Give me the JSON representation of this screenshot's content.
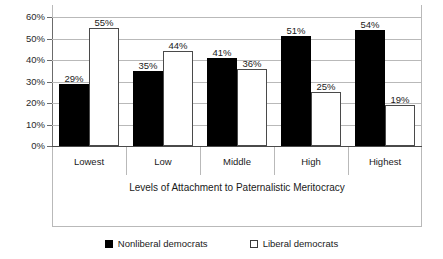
{
  "chart_data": {
    "type": "bar",
    "title": "",
    "subtitle": "",
    "xlabel": "Levels of Attachment to Paternalistic Meritocracy",
    "ylabel": "",
    "categories": [
      "Lowest",
      "Low",
      "Middle",
      "High",
      "Highest"
    ],
    "series": [
      {
        "name": "Nonliberal democrats",
        "values": [
          29,
          35,
          41,
          51,
          54
        ],
        "labels": [
          "29%",
          "35%",
          "41%",
          "51%",
          "54%"
        ],
        "color": "#000000",
        "swatch": "filled-square"
      },
      {
        "name": "Liberal democrats",
        "values": [
          55,
          44,
          36,
          25,
          19
        ],
        "labels": [
          "55%",
          "44%",
          "36%",
          "25%",
          "19%"
        ],
        "color": "#ffffff",
        "swatch": "open-square"
      }
    ],
    "ylim": [
      0,
      60
    ],
    "ytick_values": [
      0,
      10,
      20,
      30,
      40,
      50,
      60
    ],
    "ytick_labels": [
      "0%",
      "10%",
      "20%",
      "30%",
      "40%",
      "50%",
      "60%"
    ],
    "grid": true,
    "grid_color": "#b9b9b9",
    "legend_position": "bottom",
    "value_labels": true
  }
}
